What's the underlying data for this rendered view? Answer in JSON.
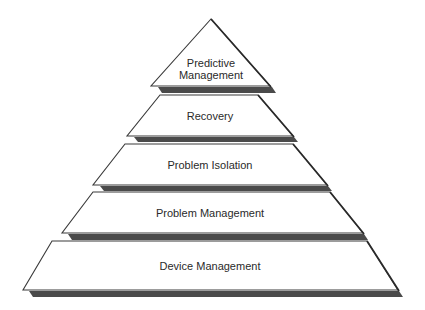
{
  "diagram": {
    "type": "pyramid",
    "colors": {
      "fill": "#ffffff",
      "outline": "#3a3a3a",
      "shadow": "#4a4a4a",
      "text": "#2a2a2a"
    },
    "tiers": [
      {
        "label_line1": "Predictive",
        "label_line2": "Management"
      },
      {
        "label_line1": "Recovery",
        "label_line2": ""
      },
      {
        "label_line1": "Problem Isolation",
        "label_line2": ""
      },
      {
        "label_line1": "Problem Management",
        "label_line2": ""
      },
      {
        "label_line1": "Device Management",
        "label_line2": ""
      }
    ]
  }
}
